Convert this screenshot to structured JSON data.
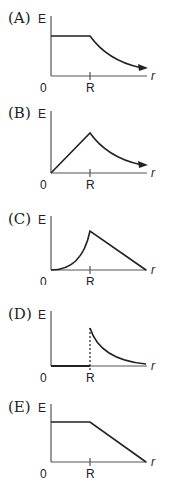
{
  "figure": {
    "axis_labels": {
      "y": "E",
      "x": "r",
      "origin": "0",
      "tick": "R"
    },
    "colors": {
      "curve": "#222222",
      "axis": "#555555",
      "background": "#ffffff"
    }
  },
  "options": [
    {
      "label": "(A)",
      "shape": "constant for r<R, then decreasing curve beyond R (arrow)"
    },
    {
      "label": "(B)",
      "shape": "linear increase from 0 to R, then decreasing curve beyond R (arrow)"
    },
    {
      "label": "(C)",
      "shape": "concave-up increase from 0 to R, then linear decrease to zero"
    },
    {
      "label": "(D)",
      "shape": "zero for r<R, jump at R (dashed line), then decreasing curve"
    },
    {
      "label": "(E)",
      "shape": "constant for r<R, then linear decrease to zero"
    }
  ]
}
